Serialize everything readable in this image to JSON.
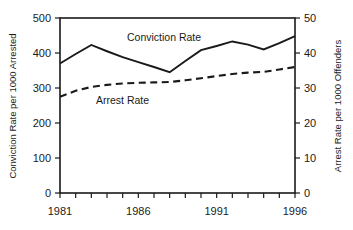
{
  "chart_data": {
    "type": "line",
    "title": "",
    "subtitle": "",
    "xlabel": "",
    "ylabel": "Conviction Rate per 1000 Arrested",
    "y2label": "Arrest Rate per 1000 Offenders",
    "x": [
      1981,
      1982,
      1983,
      1984,
      1985,
      1986,
      1987,
      1988,
      1989,
      1990,
      1991,
      1992,
      1993,
      1994,
      1995,
      1996
    ],
    "xlim": [
      1981,
      1996
    ],
    "ylim": [
      0,
      500
    ],
    "y2lim": [
      0,
      50
    ],
    "xticks": [
      1981,
      1982,
      1983,
      1984,
      1985,
      1986,
      1987,
      1988,
      1989,
      1990,
      1991,
      1992,
      1993,
      1994,
      1995,
      1996
    ],
    "xtick_labels_shown": [
      "1981",
      "1986",
      "1991",
      "1996"
    ],
    "yticks": [
      0,
      100,
      200,
      300,
      400,
      500
    ],
    "ytick_labels": [
      "0",
      "100",
      "200",
      "300",
      "400",
      "500"
    ],
    "y2ticks": [
      0,
      10,
      20,
      30,
      40,
      50
    ],
    "y2tick_labels": [
      "0",
      "10",
      "20",
      "30",
      "40",
      "50"
    ],
    "grid": false,
    "legend_position": "inline-annotations",
    "series": [
      {
        "name": "Conviction Rate",
        "axis": "left",
        "style": "solid",
        "color": "#1a1a1a",
        "values": [
          370,
          397,
          423,
          405,
          388,
          374,
          360,
          345,
          377,
          408,
          420,
          433,
          424,
          410,
          428,
          448
        ]
      },
      {
        "name": "Arrest Rate",
        "axis": "right",
        "style": "dashed",
        "color": "#1a1a1a",
        "values": [
          27.5,
          29.2,
          30.3,
          30.9,
          31.3,
          31.5,
          31.6,
          31.7,
          32.2,
          32.8,
          33.4,
          34.0,
          34.4,
          34.6,
          35.3,
          36.0
        ]
      }
    ],
    "annotations": [
      {
        "text": "Conviction Rate",
        "x": 1985.1,
        "y": 462,
        "axis": "left"
      },
      {
        "text": "Arrest Rate",
        "x": 1983.0,
        "y": 292,
        "axis": "left"
      }
    ]
  },
  "axes": {
    "left_title": "Conviction Rate per 1000 Arrested",
    "right_title": "Arrest Rate per 1000 Offenders",
    "x_labels": [
      "1981",
      "1986",
      "1991",
      "1996"
    ],
    "y_labels": [
      "500",
      "400",
      "300",
      "200",
      "100",
      "0"
    ],
    "y2_labels": [
      "50",
      "40",
      "30",
      "20",
      "10",
      "0"
    ]
  },
  "series_labels": {
    "conviction": "Conviction Rate",
    "arrest": "Arrest Rate"
  },
  "colors": {
    "ink": "#1a1a1a",
    "background": "#ffffff"
  }
}
